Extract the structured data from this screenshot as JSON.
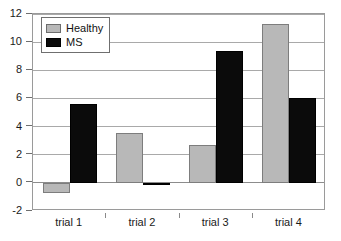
{
  "chart_data": {
    "type": "bar",
    "title": "",
    "subtitle": "",
    "xlabel": "",
    "ylabel": "",
    "categories": [
      "trial 1",
      "trial 2",
      "trial 3",
      "trial 4"
    ],
    "series": [
      {
        "name": "Healthy",
        "color": "#b8b8b8",
        "values": [
          -0.7,
          3.55,
          2.7,
          11.3
        ]
      },
      {
        "name": "MS",
        "color": "#0b0b0b",
        "values": [
          5.6,
          -0.15,
          9.4,
          6.05
        ]
      }
    ],
    "ylim": [
      -2,
      12
    ],
    "ytick_values": [
      12,
      10,
      8,
      6,
      4,
      2,
      0,
      -2
    ],
    "ytick_labels": [
      "12",
      "10",
      "8",
      "6",
      "4",
      "2",
      "0",
      "-2"
    ],
    "grid": true,
    "grid_axis": "y",
    "legend": {
      "position": "upper-left-inside",
      "entries": [
        "Healthy",
        "MS"
      ]
    },
    "annotations": []
  },
  "colors": {
    "healthy": "#b8b8b8",
    "ms": "#0b0b0b",
    "gridline": "#a9a9a9",
    "frame": "#9a9a9a",
    "text": "#1a1a1a",
    "background": "#ffffff"
  }
}
